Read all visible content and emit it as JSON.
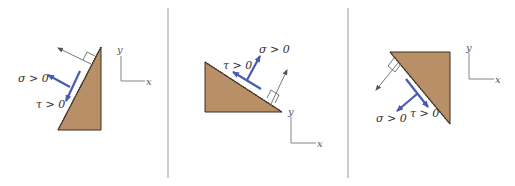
{
  "colors": {
    "wedge_fill": "#b88f66",
    "wedge_edge": "#3a2e22",
    "stress_arrow": "#4a5ab0",
    "normal_line": "#555555",
    "axes": "#777777",
    "divider": "#999999",
    "text": "#333333"
  },
  "panels": [
    {
      "id": "panel-1",
      "sigma_label": "σ > 0",
      "tau_label": "τ > 0",
      "axis_x_label": "x",
      "axis_y_label": "y"
    },
    {
      "id": "panel-2",
      "sigma_label": "σ > 0",
      "tau_label": "τ > 0",
      "axis_x_label": "x",
      "axis_y_label": "y"
    },
    {
      "id": "panel-3",
      "sigma_label": "σ > 0",
      "tau_label": "τ > 0",
      "axis_x_label": "x",
      "axis_y_label": "y"
    }
  ]
}
